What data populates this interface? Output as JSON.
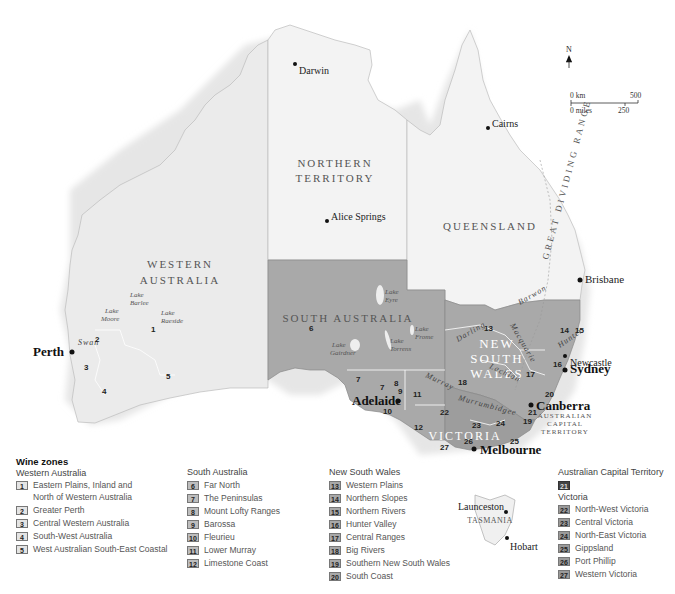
{
  "map": {
    "compass": {
      "label": "N"
    },
    "scale": {
      "km_start": "0 km",
      "km_end": "500",
      "miles_start": "0 miles",
      "miles_mid": "250"
    },
    "states": {
      "wa": "WESTERN AUSTRALIA",
      "wa_line1": "WESTERN",
      "wa_line2": "AUSTRALIA",
      "nt_line1": "NORTHERN",
      "nt_line2": "TERRITORY",
      "qld": "QUEENSLAND",
      "sa": "SOUTH AUSTRALIA",
      "nsw_line1": "NEW",
      "nsw_line2": "SOUTH",
      "nsw_line3": "WALES",
      "vic": "VICTORIA",
      "act_line1": "AUSTRALIAN",
      "act_line2": "CAPITAL",
      "act_line3": "TERRITORY",
      "tas": "TASMANIA"
    },
    "cities": {
      "darwin": "Darwin",
      "cairns": "Cairns",
      "alice_springs": "Alice Springs",
      "brisbane": "Brisbane",
      "perth": "Perth",
      "adelaide": "Adelaide",
      "sydney": "Sydney",
      "newcastle": "Newcastle",
      "canberra": "Canberra",
      "melbourne": "Melbourne",
      "launceston": "Launceston",
      "hobart": "Hobart"
    },
    "lakes": {
      "barlee_1": "Lake",
      "barlee_2": "Barlee",
      "moore_1": "Lake",
      "moore_2": "Moore",
      "raeside_1": "Lake",
      "raeside_2": "Raeside",
      "eyre_1": "Lake",
      "eyre_2": "Eyre",
      "frome_1": "Lake",
      "frome_2": "Frome",
      "gairdner_1": "Lake",
      "gairdner_2": "Gairdner",
      "torrens_1": "Lake",
      "torrens_2": "Torrens"
    },
    "rivers": {
      "swan": "Swan",
      "darling": "Darling",
      "barwon": "Barwon",
      "macquarie": "Macquarie",
      "lachlan": "Lachlan",
      "murray": "Murray",
      "murrumbidgee": "Murrumbidgee",
      "hunter": "Hunter"
    },
    "range": {
      "label": "GREAT DIVIDING RANGE"
    },
    "zone_numbers": [
      "1",
      "2",
      "3",
      "4",
      "5",
      "6",
      "7",
      "7",
      "8",
      "9",
      "10",
      "11",
      "12",
      "13",
      "14",
      "15",
      "16",
      "17",
      "18",
      "19",
      "20",
      "21",
      "22",
      "23",
      "24",
      "25",
      "26",
      "27"
    ]
  },
  "legend": {
    "title": "Wine zones",
    "groups": [
      {
        "name": "Western Australia",
        "items": [
          {
            "num": "1",
            "label": "Eastern Plains, Inland and",
            "label2": "North of Western Australia"
          },
          {
            "num": "2",
            "label": "Greater Perth"
          },
          {
            "num": "3",
            "label": "Central Western Australia"
          },
          {
            "num": "4",
            "label": "South-West Australia"
          },
          {
            "num": "5",
            "label": "West Australian South-East Coastal"
          }
        ]
      },
      {
        "name": "South Australia",
        "items": [
          {
            "num": "6",
            "label": "Far North"
          },
          {
            "num": "7",
            "label": "The Peninsulas"
          },
          {
            "num": "8",
            "label": "Mount Lofty Ranges"
          },
          {
            "num": "9",
            "label": "Barossa"
          },
          {
            "num": "10",
            "label": "Fleurieu"
          },
          {
            "num": "11",
            "label": "Lower Murray"
          },
          {
            "num": "12",
            "label": "Limestone Coast"
          }
        ]
      },
      {
        "name": "New South Wales",
        "items": [
          {
            "num": "13",
            "label": "Western Plains"
          },
          {
            "num": "14",
            "label": "Northern Slopes"
          },
          {
            "num": "15",
            "label": "Northern Rivers"
          },
          {
            "num": "16",
            "label": "Hunter Valley"
          },
          {
            "num": "17",
            "label": "Central Ranges"
          },
          {
            "num": "18",
            "label": "Big Rivers"
          },
          {
            "num": "19",
            "label": "Southern New South Wales"
          },
          {
            "num": "20",
            "label": "South Coast"
          }
        ]
      },
      {
        "name": "Australian Capital Territory",
        "items": [
          {
            "num": "21",
            "label": ""
          }
        ]
      },
      {
        "name": "Victoria",
        "items": [
          {
            "num": "22",
            "label": "North-West Victoria"
          },
          {
            "num": "23",
            "label": "Central Victoria"
          },
          {
            "num": "24",
            "label": "North-East Victoria"
          },
          {
            "num": "25",
            "label": "Gippsland"
          },
          {
            "num": "26",
            "label": "Port Phillip"
          },
          {
            "num": "27",
            "label": "Western Victoria"
          }
        ]
      }
    ]
  },
  "colors": {
    "light_state": "#ebebeb",
    "nt_qld": "#f3f3f3",
    "sa_nsw_vic": "#a9a9a9",
    "wa_badge": "#e4e4e4",
    "sa_badge": "#bdbdbd",
    "nsw_badge": "#a8a8a8",
    "act_badge": "#444444",
    "vic_badge": "#9a9a9a"
  }
}
